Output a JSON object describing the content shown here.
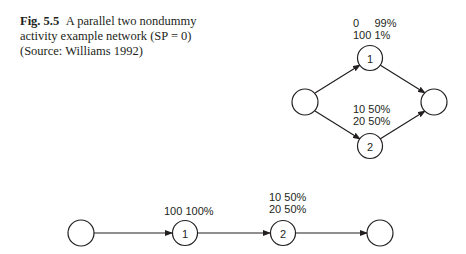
{
  "caption": {
    "fig_label": "Fig. 5.5",
    "text": "A parallel two nondummy activity example network (SP = 0) (Source: Williams 1992)"
  },
  "parallel_network": {
    "nodes": [
      {
        "id": "start",
        "label": ""
      },
      {
        "id": "1",
        "label": "1"
      },
      {
        "id": "2",
        "label": "2"
      },
      {
        "id": "end",
        "label": ""
      }
    ],
    "activity_1_annotation": [
      "0     99%",
      "100 1%"
    ],
    "activity_2_annotation": [
      "10 50%",
      "20 50%"
    ]
  },
  "series_network": {
    "nodes": [
      {
        "id": "start",
        "label": ""
      },
      {
        "id": "1",
        "label": "1"
      },
      {
        "id": "2",
        "label": "2"
      },
      {
        "id": "end",
        "label": ""
      }
    ],
    "activity_1_annotation": [
      "100 100%"
    ],
    "activity_2_annotation": [
      "10 50%",
      "20 50%"
    ]
  }
}
